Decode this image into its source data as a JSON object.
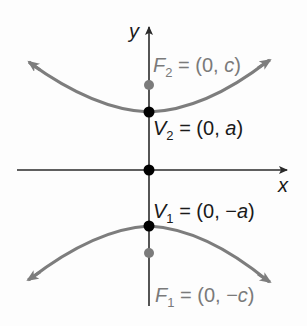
{
  "diagram": {
    "axes": {
      "x_label": "x",
      "y_label": "y"
    },
    "points": [
      {
        "id": "F2",
        "name": "F",
        "sub": "2",
        "coords": "(0, c)",
        "lhs_sep": " = ",
        "color": "#7b7b7b"
      },
      {
        "id": "V2",
        "name": "V",
        "sub": "2",
        "coords": "(0, a)",
        "color": "#000000"
      },
      {
        "id": "O",
        "name": "origin",
        "color": "#000000"
      },
      {
        "id": "V1",
        "name": "V",
        "sub": "1",
        "coords": "(0, −a)",
        "color": "#000000"
      },
      {
        "id": "F1",
        "name": "F",
        "sub": "1",
        "coords": "(0, −c)",
        "color": "#7b7b7b"
      }
    ],
    "labels": {
      "F2_eq": " = (0, ",
      "F2_var": "c",
      "F2_end": ")",
      "V2_eq": " = (0, ",
      "V2_var": "a",
      "V2_end": ")",
      "V1_eq": " = (0, −",
      "V1_var": "a",
      "V1_end": ")",
      "F1_eq": " = (0, −",
      "F1_var": "c",
      "F1_end": ")",
      "F": "F",
      "V": "V",
      "one": "1",
      "two": "2"
    },
    "colors": {
      "curve": "#7d7d7d",
      "axis": "#2a2a2a",
      "focus": "#7b7b7b",
      "vertex": "#000000"
    }
  }
}
